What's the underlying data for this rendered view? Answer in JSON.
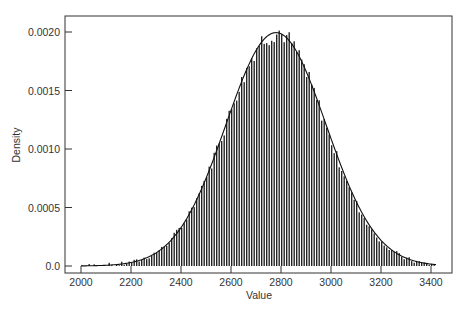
{
  "chart_data": {
    "type": "bar",
    "subtype": "histogram_with_density_curve",
    "title": "",
    "xlabel": "Value",
    "ylabel": "Density",
    "xlim": [
      1940,
      3490
    ],
    "ylim": [
      -6e-05,
      0.00216
    ],
    "xticks": [
      2000,
      2200,
      2400,
      2600,
      2800,
      3000,
      3200,
      3400
    ],
    "xtick_labels": [
      "2000",
      "2200",
      "2400",
      "2600",
      "2800",
      "3000",
      "3200",
      "3400"
    ],
    "yticks": [
      0.0,
      0.0005,
      0.001,
      0.0015,
      0.002
    ],
    "ytick_labels": [
      "0.0",
      "0.0005",
      "0.0010",
      "0.0015",
      "0.0020"
    ],
    "grid": false,
    "legend": null,
    "histogram": {
      "range": [
        2000,
        3420
      ],
      "bin_width": 10,
      "approx_peak_value": 2790,
      "approx_peak_density": 0.00207
    },
    "density_curve": {
      "distribution": "normal",
      "mean": 2780,
      "sd": 200,
      "range": [
        2000,
        3420
      ]
    },
    "series": [
      {
        "name": "fitted density",
        "x": [
          2000,
          2100,
          2200,
          2300,
          2400,
          2500,
          2600,
          2700,
          2780,
          2800,
          2900,
          3000,
          3100,
          3200,
          3300,
          3400
        ],
        "values": [
          1e-05,
          3.1e-05,
          7.5e-05,
          0.000158,
          0.000328,
          0.000562,
          0.000833,
          0.001845,
          0.001995,
          0.001985,
          0.001854,
          0.001081,
          0.000601,
          0.000215,
          6.7e-05,
          1.7e-05
        ]
      }
    ]
  }
}
